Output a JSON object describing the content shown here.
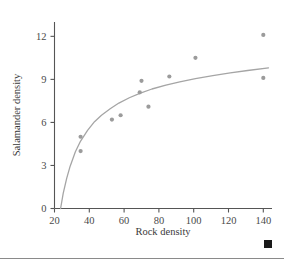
{
  "chart_data": {
    "type": "scatter",
    "title": "",
    "xlabel": "Rock density",
    "ylabel": "Salamander density",
    "xlim": [
      20,
      145
    ],
    "ylim": [
      0,
      13
    ],
    "xticks": [
      20,
      40,
      60,
      80,
      100,
      120,
      140
    ],
    "yticks": [
      0,
      3,
      6,
      9,
      12
    ],
    "grid": false,
    "legend": null,
    "series": [
      {
        "name": "observations",
        "marker": "filled-circle",
        "color": "#9b9b9b",
        "points": [
          {
            "x": 35,
            "y": 5.0
          },
          {
            "x": 35,
            "y": 4.0
          },
          {
            "x": 53,
            "y": 6.2
          },
          {
            "x": 58,
            "y": 6.5
          },
          {
            "x": 69,
            "y": 8.1
          },
          {
            "x": 70,
            "y": 8.9
          },
          {
            "x": 74,
            "y": 7.1
          },
          {
            "x": 86,
            "y": 9.2
          },
          {
            "x": 101,
            "y": 10.5
          },
          {
            "x": 140,
            "y": 12.1
          },
          {
            "x": 140,
            "y": 9.1
          }
        ]
      },
      {
        "name": "fitted-curve",
        "marker": "line",
        "color": "#a5a5a5",
        "points": [
          {
            "x": 23.5,
            "y": 0.0
          },
          {
            "x": 25,
            "y": 1.05
          },
          {
            "x": 27,
            "y": 2.1
          },
          {
            "x": 29,
            "y": 2.95
          },
          {
            "x": 32,
            "y": 3.95
          },
          {
            "x": 35,
            "y": 4.7
          },
          {
            "x": 39,
            "y": 5.45
          },
          {
            "x": 43,
            "y": 6.05
          },
          {
            "x": 47,
            "y": 6.5
          },
          {
            "x": 52,
            "y": 6.95
          },
          {
            "x": 57,
            "y": 7.35
          },
          {
            "x": 63,
            "y": 7.72
          },
          {
            "x": 69,
            "y": 8.03
          },
          {
            "x": 76,
            "y": 8.33
          },
          {
            "x": 84,
            "y": 8.6
          },
          {
            "x": 92,
            "y": 8.83
          },
          {
            "x": 101,
            "y": 9.05
          },
          {
            "x": 111,
            "y": 9.26
          },
          {
            "x": 121,
            "y": 9.45
          },
          {
            "x": 131,
            "y": 9.62
          },
          {
            "x": 143,
            "y": 9.8
          }
        ]
      }
    ]
  },
  "axis": {
    "x_tick_labels": [
      "20",
      "40",
      "60",
      "80",
      "100",
      "120",
      "140"
    ],
    "y_tick_labels": [
      "0",
      "3",
      "6",
      "9",
      "12"
    ],
    "x_title": "Rock density",
    "y_title": "Salamander density"
  },
  "decorations": {
    "corner_marker": "filled-square-marker",
    "rule": "horizontal-rule"
  },
  "colors": {
    "axis": "#555555",
    "marker": "#9b9b9b",
    "curve": "#a5a5a5",
    "text": "#3a3a3a",
    "rule": "#8a8a8a",
    "corner": "#1a1a1a"
  }
}
